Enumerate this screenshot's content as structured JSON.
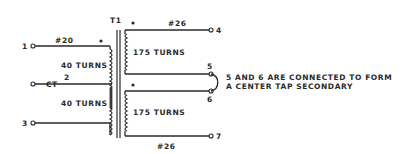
{
  "diagram": {
    "type": "transformer-schematic",
    "transformer": {
      "label": "T1"
    },
    "primary": {
      "wire_gauge": "#20",
      "upper_winding": {
        "turns_label": "40 TURNS"
      },
      "lower_winding": {
        "turns_label": "40 TURNS"
      },
      "terminals": [
        {
          "id": "1",
          "label": "1"
        },
        {
          "id": "2",
          "label": "2",
          "name": "CT"
        },
        {
          "id": "3",
          "label": "3"
        }
      ]
    },
    "secondary": {
      "wire_gauge_top": "#26",
      "wire_gauge_bottom": "#26",
      "upper_winding": {
        "turns_label": "175 TURNS"
      },
      "lower_winding": {
        "turns_label": "175 TURNS"
      },
      "terminals": [
        {
          "id": "4",
          "label": "4"
        },
        {
          "id": "5",
          "label": "5"
        },
        {
          "id": "6",
          "label": "6"
        },
        {
          "id": "7",
          "label": "7"
        }
      ]
    },
    "note": {
      "line1": "5 AND 6 ARE CONNECTED TO FORM",
      "line2": "A CENTER TAP SECONDARY"
    },
    "colors": {
      "ink": "#2a2a2a",
      "background": "#ffffff"
    }
  }
}
